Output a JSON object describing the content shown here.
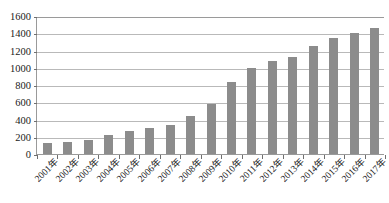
{
  "chart_data": {
    "type": "bar",
    "title": "",
    "subtitle": "",
    "xlabel": "",
    "ylabel": "",
    "ylim": [
      0,
      1600
    ],
    "yticks": [
      0,
      200,
      400,
      600,
      800,
      1000,
      1200,
      1400,
      1600
    ],
    "grid": true,
    "legend": false,
    "legend_position": "none",
    "bar_color": "#8c8c8c",
    "axis_color": "#9a9a9a",
    "gridline_color": "#b9b9b9",
    "categories": [
      "2001年",
      "2002年",
      "2003年",
      "2004年",
      "2005年",
      "2006年",
      "2007年",
      "2008年",
      "2009年",
      "2010年",
      "2011年",
      "2012年",
      "2013年",
      "2014年",
      "2015年",
      "2016年",
      "2017年"
    ],
    "values": [
      130,
      140,
      160,
      220,
      270,
      300,
      340,
      440,
      580,
      840,
      1000,
      1080,
      1130,
      1250,
      1350,
      1400,
      1460
    ]
  }
}
